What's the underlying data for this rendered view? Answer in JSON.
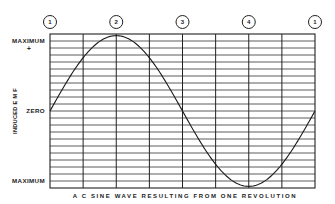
{
  "chart_data": {
    "type": "line",
    "title": "A C SINE WAVE RESULTING FROM ONE REVOLUTION",
    "xlabel": "A C SINE WAVE RESULTING FROM ONE REVOLUTION",
    "ylabel": "INDUCED E M F",
    "y_tick_labels": {
      "top": "MAXIMUM",
      "top_sign": "+",
      "middle": "ZERO",
      "bottom": "MAXIMUM",
      "bottom_sign": "-"
    },
    "position_markers": [
      "1",
      "2",
      "3",
      "4",
      "1"
    ],
    "x_degrees": [
      0,
      45,
      90,
      135,
      180,
      225,
      270,
      315,
      360
    ],
    "values": [
      0,
      0.707,
      1,
      0.707,
      0,
      -0.707,
      -1,
      -0.707,
      0
    ],
    "ylim": [
      -1,
      1
    ],
    "xlim": [
      0,
      360
    ],
    "grid": true,
    "grid_vertical_divisions": 8,
    "grid_horizontal_divisions": 22,
    "legend": null
  },
  "layout": {
    "plot_left": 50,
    "plot_right": 315,
    "plot_top": 34,
    "plot_bottom": 188,
    "marker_y": 22,
    "marker_radius": 6.5
  }
}
